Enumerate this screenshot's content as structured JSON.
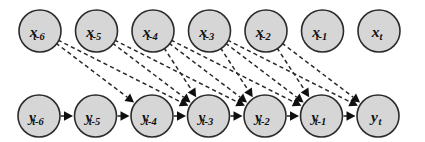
{
  "figure": {
    "kind": "probabilistic-graphical-model",
    "width": 425,
    "height": 142,
    "background_color": "#ffffff"
  },
  "style": {
    "node_fill": "#d6d6d6",
    "node_stroke": "#2b2b2b",
    "node_radius": 21,
    "chain_edge_color": "#1d1d1d",
    "cross_edge_color": "#2a2a2a",
    "cross_edge_dash": "4.2 3.1",
    "label_color": "#111111"
  },
  "rows": {
    "x_row": {
      "name": "x-variable-row",
      "center_y": 31,
      "start_x": 40,
      "spacing": 56.5
    },
    "y_row": {
      "name": "y-variable-row",
      "center_y": 116,
      "start_x": 39,
      "spacing": 56.5
    }
  },
  "x_nodes": [
    {
      "id": "x_t-6",
      "base": "x",
      "sub": "t-6",
      "cx": 40,
      "cy": 31
    },
    {
      "id": "x_t-5",
      "base": "x",
      "sub": "t-5",
      "cx": 96.5,
      "cy": 31
    },
    {
      "id": "x_t-4",
      "base": "x",
      "sub": "t-4",
      "cx": 153,
      "cy": 31
    },
    {
      "id": "x_t-3",
      "base": "x",
      "sub": "t-3",
      "cx": 209.5,
      "cy": 31
    },
    {
      "id": "x_t-2",
      "base": "x",
      "sub": "t-2",
      "cx": 266,
      "cy": 31
    },
    {
      "id": "x_t-1",
      "base": "x",
      "sub": "t-1",
      "cx": 322.5,
      "cy": 31
    },
    {
      "id": "x_t",
      "base": "x",
      "sub": "t",
      "cx": 379,
      "cy": 31
    }
  ],
  "y_nodes": [
    {
      "id": "y_t-6",
      "base": "y",
      "sub": "t-6",
      "cx": 39,
      "cy": 116
    },
    {
      "id": "y_t-5",
      "base": "y",
      "sub": "t-5",
      "cx": 95.5,
      "cy": 116
    },
    {
      "id": "y_t-4",
      "base": "y",
      "sub": "t-4",
      "cx": 152,
      "cy": 116
    },
    {
      "id": "y_t-3",
      "base": "y",
      "sub": "t-3",
      "cx": 208.5,
      "cy": 116
    },
    {
      "id": "y_t-2",
      "base": "y",
      "sub": "t-2",
      "cx": 265,
      "cy": 116
    },
    {
      "id": "y_t-1",
      "base": "y",
      "sub": "t-1",
      "cx": 321.5,
      "cy": 116
    },
    {
      "id": "y_t",
      "base": "y",
      "sub": "t",
      "cx": 378,
      "cy": 116
    }
  ],
  "chain_edges": [
    {
      "from": "y_t-6",
      "to": "y_t-5"
    },
    {
      "from": "y_t-5",
      "to": "y_t-4"
    },
    {
      "from": "y_t-4",
      "to": "y_t-3"
    },
    {
      "from": "y_t-3",
      "to": "y_t-2"
    },
    {
      "from": "y_t-2",
      "to": "y_t-1"
    },
    {
      "from": "y_t-1",
      "to": "y_t"
    }
  ],
  "cross_edges": [
    {
      "from": "x_t-6",
      "to": "y_t-4"
    },
    {
      "from": "x_t-6",
      "to": "y_t-3"
    },
    {
      "from": "x_t-5",
      "to": "y_t-3"
    },
    {
      "from": "x_t-5",
      "to": "y_t-2"
    },
    {
      "from": "x_t-4",
      "to": "y_t-3"
    },
    {
      "from": "x_t-4",
      "to": "y_t-2"
    },
    {
      "from": "x_t-4",
      "to": "y_t-1"
    },
    {
      "from": "x_t-3",
      "to": "y_t-2"
    },
    {
      "from": "x_t-3",
      "to": "y_t-1"
    },
    {
      "from": "x_t-3",
      "to": "y_t"
    },
    {
      "from": "x_t-2",
      "to": "y_t-1"
    },
    {
      "from": "x_t-2",
      "to": "y_t"
    }
  ]
}
